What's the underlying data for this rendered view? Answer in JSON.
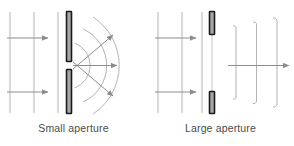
{
  "figure": {
    "title": "",
    "panels": [
      {
        "id": "small-aperture",
        "caption": "Small aperture",
        "incoming_wavefronts": 3,
        "incoming_arrows": 2,
        "barrier_bars": 2,
        "aperture_size": "small",
        "outgoing_wavefronts": 3,
        "outgoing_wavefront_shape": "circular-arc",
        "outgoing_arrows": 3,
        "outgoing_arrow_angles_deg": [
          -40,
          0,
          40
        ],
        "description": "Plane waves passing through a small aperture spread out into circular wavefronts"
      },
      {
        "id": "large-aperture",
        "caption": "Large aperture",
        "incoming_wavefronts": 3,
        "incoming_arrows": 2,
        "barrier_bars": 2,
        "aperture_size": "large",
        "outgoing_wavefronts": 3,
        "outgoing_wavefront_shape": "straight-with-curved-edges",
        "outgoing_arrows": 1,
        "outgoing_arrow_angles_deg": [
          0
        ],
        "description": "Plane waves passing through a large aperture stay mostly straight with slight edge curvature"
      }
    ]
  },
  "colors": {
    "wavefront_line": "#b3b3b3",
    "arrow_line": "#8c8c8c",
    "barrier_outline": "#1a1a1a",
    "barrier_fill": "#a6a6a6",
    "caption_text": "#4c4c4c",
    "background": "#ffffff"
  }
}
